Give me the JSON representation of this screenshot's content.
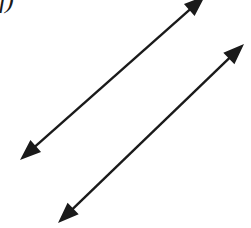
{
  "figure": {
    "label": "f)",
    "background_color": "#ffffff",
    "stroke_color": "#1a1a1a",
    "stroke_width": 2.4,
    "arrowhead_length": 21,
    "arrowhead_half_width": 8,
    "arrows": [
      {
        "name": "arrow-upper-left",
        "description": "double-headed arrow, lower-left to upper-right, head cropped at top edge",
        "x1": 20,
        "y1": 160,
        "x2": 205,
        "y2": -4,
        "double_headed": true,
        "slope_deg": -41.5
      },
      {
        "name": "arrow-lower-right",
        "description": "double-headed arrow, lower-left to upper-right, parallel to the first",
        "x1": 58,
        "y1": 223,
        "x2": 244,
        "y2": 44,
        "double_headed": true,
        "slope_deg": -43.9
      }
    ]
  }
}
